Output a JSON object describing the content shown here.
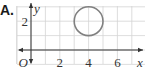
{
  "option": {
    "label": "A."
  },
  "chart_data": {
    "type": "scatter",
    "title": "",
    "xlabel": "x",
    "ylabel": "y",
    "origin_label": "O",
    "xlim": [
      -1,
      8
    ],
    "ylim": [
      -1,
      3
    ],
    "grid": true,
    "x_ticks": [
      2,
      4,
      6
    ],
    "x_tick_labels": [
      "2",
      "4",
      "6"
    ],
    "y_ticks": [
      2
    ],
    "y_tick_labels": [
      "2"
    ],
    "shapes": [
      {
        "shape": "circle",
        "center": [
          4,
          2
        ],
        "radius": 1,
        "stroke": "#808080"
      }
    ]
  },
  "colors": {
    "grid": "#d4d4d4",
    "axis": "#333333",
    "circle": "#808080",
    "text": "#333333"
  }
}
